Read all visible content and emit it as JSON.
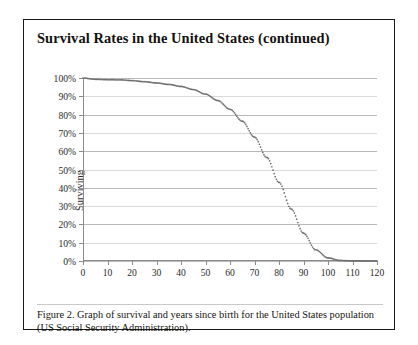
{
  "scan_header": "",
  "figure": {
    "title": "Survival Rates in the United States (continued)",
    "caption": "Figure 2. Graph of survival and years since birth for the United States population (US Social Security Administration)."
  },
  "colors": {
    "frame": "#1a1a1a",
    "text": "#14120f",
    "gridline": "#d9d9d9",
    "axis": "#8c8c8c",
    "curve": "#6e6e6e"
  },
  "chart_data": {
    "type": "line",
    "title": "Survival Rates in the United States (continued)",
    "xlabel": "",
    "ylabel": "Surviving",
    "xlim": [
      0,
      120
    ],
    "ylim": [
      0,
      100
    ],
    "grid": true,
    "legend": "none",
    "marker": "dotted",
    "xticks": [
      0,
      10,
      20,
      30,
      40,
      50,
      60,
      70,
      80,
      90,
      100,
      110,
      120
    ],
    "xtick_labels": [
      "0",
      "10",
      "20",
      "30",
      "40",
      "50",
      "60",
      "70",
      "80",
      "90",
      "100",
      "110",
      "120"
    ],
    "yticks": [
      0,
      10,
      20,
      30,
      40,
      50,
      60,
      70,
      80,
      90,
      100
    ],
    "ytick_labels": [
      "0%",
      "10%",
      "20%",
      "30%",
      "40%",
      "50%",
      "60%",
      "70%",
      "80%",
      "90%",
      "100%"
    ],
    "series": [
      {
        "name": "Surviving",
        "x": [
          0,
          5,
          10,
          15,
          20,
          25,
          30,
          35,
          40,
          45,
          50,
          55,
          60,
          65,
          70,
          75,
          80,
          85,
          90,
          95,
          100,
          105,
          110,
          115,
          120
        ],
        "values": [
          100,
          99.3,
          99.1,
          99.0,
          98.6,
          98.0,
          97.3,
          96.5,
          95.4,
          93.7,
          91.2,
          87.7,
          82.9,
          76.4,
          67.7,
          56.6,
          43.0,
          28.4,
          15.2,
          6.1,
          1.7,
          0.3,
          0.05,
          0.0,
          0.0
        ]
      }
    ]
  }
}
